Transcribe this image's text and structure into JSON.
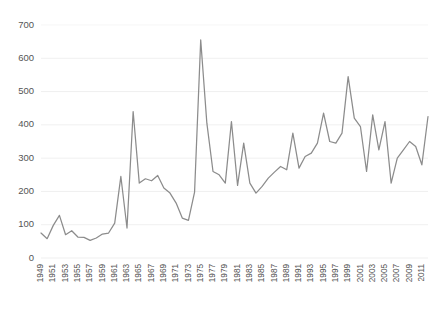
{
  "chart_data": {
    "type": "line",
    "title": "",
    "subtitle": "",
    "xlabel": "",
    "ylabel": "",
    "grid": true,
    "legend": false,
    "legend_position": "none",
    "line_color": "#8c8c8c",
    "background_color": "#ffffff",
    "grid_color": "#e8e8e8",
    "ylim": [
      0,
      700
    ],
    "yticks": [
      0,
      100,
      200,
      300,
      400,
      500,
      600,
      700
    ],
    "ytick_labels": [
      "0",
      "100",
      "200",
      "300",
      "400",
      "500",
      "600",
      "700"
    ],
    "xlim": [
      1949,
      2012
    ],
    "xticks": [
      1949,
      1951,
      1953,
      1955,
      1957,
      1959,
      1961,
      1963,
      1965,
      1967,
      1969,
      1971,
      1973,
      1975,
      1977,
      1979,
      1981,
      1983,
      1985,
      1987,
      1989,
      1991,
      1993,
      1995,
      1997,
      1999,
      2001,
      2003,
      2005,
      2007,
      2009,
      2011
    ],
    "xtick_labels": [
      "1949",
      "1951",
      "1953",
      "1955",
      "1957",
      "1959",
      "1961",
      "1963",
      "1965",
      "1967",
      "1969",
      "1971",
      "1973",
      "1975",
      "1977",
      "1979",
      "1981",
      "1983",
      "1985",
      "1987",
      "1989",
      "1991",
      "1993",
      "1995",
      "1997",
      "1999",
      "2001",
      "2003",
      "2005",
      "2007",
      "2009",
      "2011"
    ],
    "xtick_rotation": 90,
    "x": [
      1949,
      1950,
      1951,
      1952,
      1953,
      1954,
      1955,
      1956,
      1957,
      1958,
      1959,
      1960,
      1961,
      1962,
      1963,
      1964,
      1965,
      1966,
      1967,
      1968,
      1969,
      1970,
      1971,
      1972,
      1973,
      1974,
      1975,
      1976,
      1977,
      1978,
      1979,
      1980,
      1981,
      1982,
      1983,
      1984,
      1985,
      1986,
      1987,
      1988,
      1989,
      1990,
      1991,
      1992,
      1993,
      1994,
      1995,
      1996,
      1997,
      1998,
      1999,
      2000,
      2001,
      2002,
      2003,
      2004,
      2005,
      2006,
      2007,
      2008,
      2009,
      2010,
      2011,
      2012
    ],
    "values": [
      75,
      58,
      98,
      128,
      70,
      82,
      63,
      62,
      53,
      60,
      72,
      75,
      105,
      245,
      90,
      440,
      225,
      238,
      232,
      248,
      210,
      195,
      165,
      120,
      113,
      198,
      655,
      405,
      260,
      250,
      225,
      410,
      218,
      345,
      225,
      195,
      215,
      240,
      258,
      275,
      265,
      375,
      270,
      305,
      315,
      345,
      435,
      350,
      345,
      375,
      545,
      420,
      395,
      260,
      430,
      325,
      410,
      225,
      300,
      325,
      350,
      335,
      280,
      425
    ],
    "series": [
      {
        "name": "series-1",
        "values": [
          75,
          58,
          98,
          128,
          70,
          82,
          63,
          62,
          53,
          60,
          72,
          75,
          105,
          245,
          90,
          440,
          225,
          238,
          232,
          248,
          210,
          195,
          165,
          120,
          113,
          198,
          655,
          405,
          260,
          250,
          225,
          410,
          218,
          345,
          225,
          195,
          215,
          240,
          258,
          275,
          265,
          375,
          270,
          305,
          315,
          345,
          435,
          350,
          345,
          375,
          545,
          420,
          395,
          260,
          430,
          325,
          410,
          225,
          300,
          325,
          350,
          335,
          280,
          425
        ]
      }
    ],
    "annotations": []
  }
}
